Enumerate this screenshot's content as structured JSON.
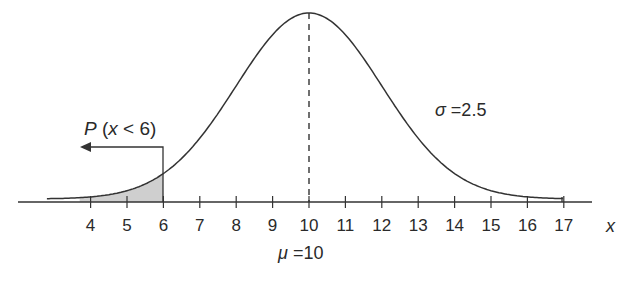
{
  "chart_data": {
    "type": "line",
    "xlabel": "x",
    "ylabel": "",
    "mean": 10,
    "std": 2.5,
    "x_ticks": [
      4,
      5,
      6,
      7,
      8,
      9,
      10,
      11,
      12,
      13,
      14,
      15,
      16,
      17
    ],
    "x_tick_labels": [
      "4",
      "5",
      "6",
      "7",
      "8",
      "9",
      "10",
      "11",
      "12",
      "13",
      "14",
      "15",
      "16",
      "17"
    ],
    "xlim": [
      2.8,
      17
    ],
    "shaded_region": {
      "from": 3.7,
      "to": 6,
      "label": "P (x < 6)"
    },
    "annotations": [
      "P (x < 6)",
      "σ = 2.5",
      "μ = 10"
    ],
    "mean_line": {
      "x": 10,
      "style": "dashed"
    },
    "grid": false,
    "legend": null
  },
  "labels": {
    "prob": "P (x < 6)",
    "prob_P": "P",
    "prob_rest": " (",
    "prob_x": "x",
    "prob_tail": " < 6)",
    "sigma_sym": "σ",
    "sigma_val": " =2.5",
    "mu_sym": "μ",
    "mu_val": " =10",
    "axis_x": "x"
  },
  "colors": {
    "line": "#333333",
    "shade": "#cfcfcf"
  }
}
